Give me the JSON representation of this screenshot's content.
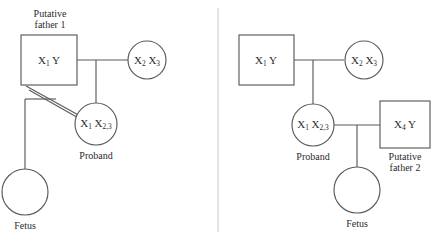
{
  "figure": {
    "line_color": "#5a5a5a",
    "divider_color": "#d4d4d4",
    "background_color": "#ffffff",
    "text_color": "#2b2b2b"
  },
  "left_panel": {
    "name": "putative-father-1-scenario",
    "caption_above_father": "Putative\nfather 1",
    "caption_above_father_line1": "Putative",
    "caption_above_father_line2": "father 1",
    "father": {
      "shape": "square",
      "genotype_main": "X",
      "genotype_sub": "1",
      "genotype_tail": " Y",
      "genotype_plain": "X1 Y"
    },
    "mother": {
      "shape": "circle",
      "allele1_main": "X",
      "allele1_sub": "2",
      "allele2_main": "X",
      "allele2_sub": "3",
      "genotype_plain": "X2 X3"
    },
    "proband": {
      "shape": "circle",
      "allele1_main": "X",
      "allele1_sub": "1",
      "allele2_main": "X",
      "allele2_sub": "2,3",
      "genotype_plain": "X1 X2,3",
      "label": "Proband"
    },
    "fetus": {
      "shape": "circle",
      "genotype_plain": "",
      "label": "Fetus"
    },
    "mating_line_style": "double",
    "mating_line_note": "double diagonal line from putative father 1 to proband"
  },
  "right_panel": {
    "name": "putative-father-2-scenario",
    "father": {
      "shape": "square",
      "genotype_main": "X",
      "genotype_sub": "1",
      "genotype_tail": " Y",
      "genotype_plain": "X1 Y"
    },
    "mother": {
      "shape": "circle",
      "allele1_main": "X",
      "allele1_sub": "2",
      "allele2_main": "X",
      "allele2_sub": "3",
      "genotype_plain": "X2 X3"
    },
    "proband": {
      "shape": "circle",
      "allele1_main": "X",
      "allele1_sub": "1",
      "allele2_main": "X",
      "allele2_sub": "2,3",
      "genotype_plain": "X1 X2,3",
      "label": "Proband"
    },
    "partner": {
      "shape": "square",
      "genotype_main": "X",
      "genotype_sub": "4",
      "genotype_tail": " Y",
      "genotype_plain": "X4 Y",
      "caption_line1": "Putative",
      "caption_line2": "father 2"
    },
    "fetus": {
      "shape": "circle",
      "genotype_plain": "",
      "label": "Fetus"
    },
    "mating_line_style": "single"
  }
}
